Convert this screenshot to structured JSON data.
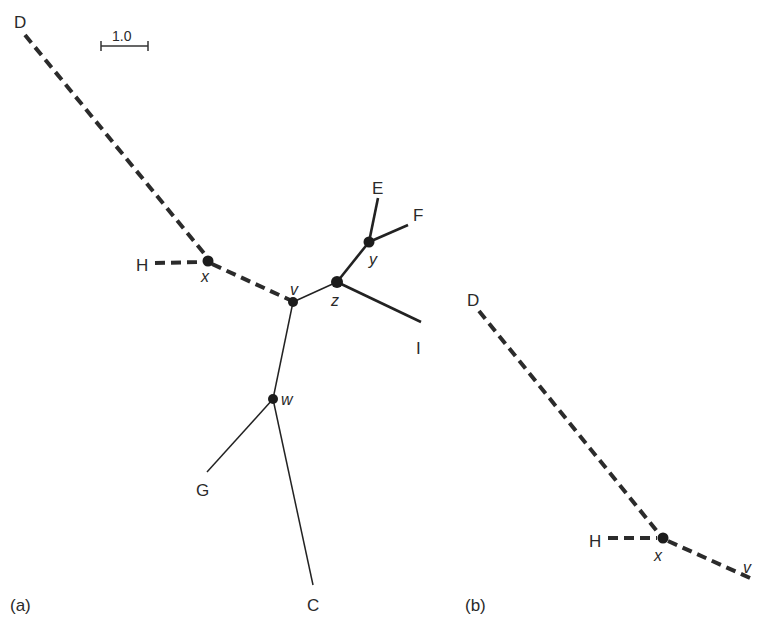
{
  "figure": {
    "scale_bar": {
      "label": "1.0"
    },
    "panel_a": {
      "label": "(a)",
      "leaves": {
        "D": "D",
        "H": "H",
        "E": "E",
        "F": "F",
        "I": "I",
        "G": "G",
        "C": "C"
      },
      "internal_nodes": {
        "x": "x",
        "v": "v",
        "z": "z",
        "y": "y",
        "w": "w"
      },
      "edges": [
        {
          "from": "D",
          "to": "x",
          "style": "dashed"
        },
        {
          "from": "H",
          "to": "x",
          "style": "dashed"
        },
        {
          "from": "x",
          "to": "v",
          "style": "dashed"
        },
        {
          "from": "v",
          "to": "z",
          "style": "solid"
        },
        {
          "from": "z",
          "to": "y",
          "style": "solid"
        },
        {
          "from": "y",
          "to": "E",
          "style": "solid"
        },
        {
          "from": "y",
          "to": "F",
          "style": "solid"
        },
        {
          "from": "z",
          "to": "I",
          "style": "solid"
        },
        {
          "from": "v",
          "to": "w",
          "style": "solid"
        },
        {
          "from": "w",
          "to": "G",
          "style": "solid"
        },
        {
          "from": "w",
          "to": "C",
          "style": "solid"
        }
      ]
    },
    "panel_b": {
      "label": "(b)",
      "leaves": {
        "D": "D",
        "H": "H"
      },
      "internal_nodes": {
        "x": "x",
        "v": "v"
      },
      "edges": [
        {
          "from": "D",
          "to": "x",
          "style": "dashed"
        },
        {
          "from": "H",
          "to": "x",
          "style": "dashed"
        },
        {
          "from": "x",
          "to": "v",
          "style": "dashed"
        }
      ]
    }
  }
}
